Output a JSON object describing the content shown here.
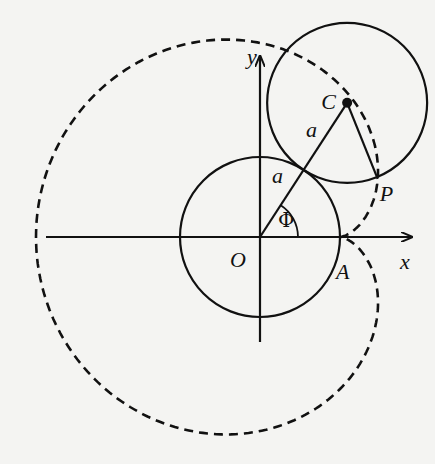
{
  "diagram": {
    "colors": {
      "background": "#f4f4f2",
      "ink": "#111111"
    },
    "origin": {
      "x": 260,
      "y": 237
    },
    "radius_a": 80,
    "cardioid_scale": 76,
    "phi_deg": 57,
    "axes": {
      "x": {
        "from": 46,
        "to": 412,
        "label": "x"
      },
      "y": {
        "from": 342,
        "to": 56,
        "label": "y"
      }
    },
    "labels": {
      "origin": "O",
      "x_axis": "x",
      "y_axis": "y",
      "center_moving": "C",
      "point_traced": "P",
      "point_start": "A",
      "radius_fixed": "a",
      "radius_moving": "a",
      "angle": "Φ"
    }
  }
}
